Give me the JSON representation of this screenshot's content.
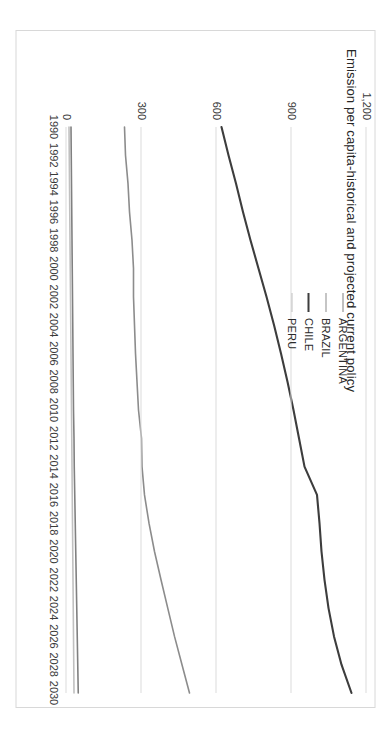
{
  "chart_data": {
    "type": "line",
    "title": "Emission per capita-historical and projected current policy",
    "xlabel": "",
    "ylabel": "",
    "xlim": [
      1990,
      2030
    ],
    "ylim": [
      0,
      1200
    ],
    "grid": true,
    "legend_position": "inside-top-center",
    "x_tick_labels": [
      "1990",
      "1992",
      "1994",
      "1996",
      "1998",
      "2000",
      "2002",
      "2004",
      "2006",
      "2008",
      "2010",
      "2012",
      "2014",
      "2016",
      "2018",
      "2020",
      "2022",
      "2024",
      "2026",
      "2028",
      "2030"
    ],
    "y_tick_labels": [
      "0",
      "300",
      "600",
      "900",
      "1,200"
    ],
    "y_ticks": [
      0,
      300,
      600,
      900,
      1200
    ],
    "x": [
      1990,
      1992,
      1994,
      1996,
      1998,
      2000,
      2002,
      2004,
      2006,
      2008,
      2010,
      2012,
      2014,
      2016,
      2018,
      2020,
      2022,
      2024,
      2026,
      2028,
      2030
    ],
    "series": [
      {
        "name": "ARGENTINA",
        "color": "#808080",
        "width": 1.6,
        "values": [
          18,
          19,
          20,
          21,
          22,
          23,
          24,
          25,
          26,
          27,
          28,
          30,
          31,
          33,
          35,
          37,
          39,
          41,
          43,
          45,
          47
        ]
      },
      {
        "name": "BRAZIL",
        "color": "#8c8c8c",
        "width": 1.6,
        "values": [
          232,
          236,
          246,
          252,
          262,
          268,
          268,
          272,
          276,
          282,
          288,
          300,
          302,
          312,
          330,
          352,
          378,
          405,
          432,
          462,
          492
        ]
      },
      {
        "name": "CHILE",
        "color": "#3d3d3d",
        "width": 2.1,
        "values": [
          620,
          648,
          678,
          706,
          736,
          768,
          800,
          830,
          858,
          884,
          908,
          930,
          952,
          1002,
          1012,
          1020,
          1032,
          1048,
          1070,
          1100,
          1140
        ]
      },
      {
        "name": "PERU",
        "color": "#c0c0c0",
        "width": 1.6,
        "values": [
          10,
          11,
          12,
          13,
          14,
          15,
          16,
          17,
          18,
          19,
          20,
          21,
          22,
          23,
          24,
          25,
          26,
          27,
          28,
          29,
          30
        ]
      }
    ]
  },
  "legend": {
    "items": [
      {
        "label": "ARGENTINA"
      },
      {
        "label": "BRAZIL"
      },
      {
        "label": "CHILE"
      },
      {
        "label": "PERU"
      }
    ]
  }
}
